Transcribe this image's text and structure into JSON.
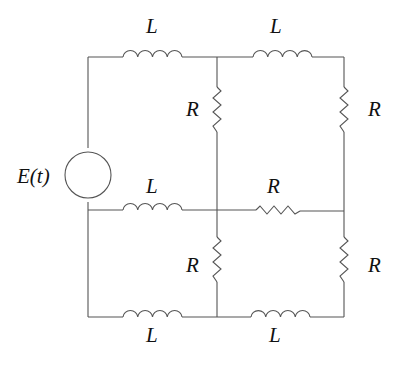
{
  "diagram": {
    "type": "electrical-circuit",
    "source": {
      "label": "E(t)",
      "kind": "voltage-source"
    },
    "components": [
      {
        "id": "L1",
        "label": "L",
        "kind": "inductor",
        "position": "top-left branch"
      },
      {
        "id": "L2",
        "label": "L",
        "kind": "inductor",
        "position": "top-right branch"
      },
      {
        "id": "R1",
        "label": "R",
        "kind": "resistor",
        "position": "upper middle vertical"
      },
      {
        "id": "R2",
        "label": "R",
        "kind": "resistor",
        "position": "upper right vertical"
      },
      {
        "id": "L3",
        "label": "L",
        "kind": "inductor",
        "position": "middle-left horizontal"
      },
      {
        "id": "R3",
        "label": "R",
        "kind": "resistor",
        "position": "middle-right horizontal"
      },
      {
        "id": "R4",
        "label": "R",
        "kind": "resistor",
        "position": "lower middle vertical"
      },
      {
        "id": "R5",
        "label": "R",
        "kind": "resistor",
        "position": "lower right vertical"
      },
      {
        "id": "L4",
        "label": "L",
        "kind": "inductor",
        "position": "bottom-left branch"
      },
      {
        "id": "L5",
        "label": "L",
        "kind": "inductor",
        "position": "bottom-right branch"
      }
    ]
  }
}
